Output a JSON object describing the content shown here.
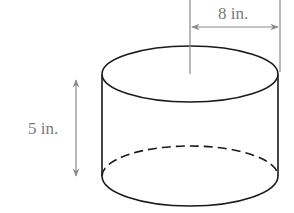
{
  "diagram": {
    "type": "cylinder",
    "labels": {
      "radius": "8 in.",
      "height": "5 in."
    },
    "colors": {
      "outline": "#1a1a1a",
      "dimension": "#8a8a8a",
      "label": "#7a7a7a",
      "background": "#ffffff"
    }
  }
}
